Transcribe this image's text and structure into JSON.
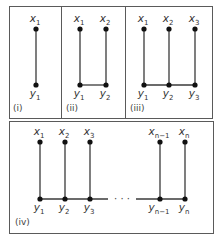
{
  "colors": {
    "border": "#5a5a5a",
    "edge": "#3a3a3a",
    "node": "#111111",
    "text": "#333333"
  },
  "panels": [
    {
      "id": "i",
      "caption": "(i)",
      "box": {
        "x": 9,
        "y": 6,
        "w": 52,
        "h": 112
      },
      "caption_pos": {
        "x": 13,
        "y": 111
      },
      "top_y": 29,
      "bottom_y": 85,
      "columns": [
        {
          "x": 36,
          "top": "x",
          "top_sub": "1",
          "bottom": "y",
          "bottom_sub": "1"
        }
      ],
      "base_line": null
    },
    {
      "id": "ii",
      "caption": "(ii)",
      "box": {
        "x": 61,
        "y": 6,
        "w": 64,
        "h": 112
      },
      "caption_pos": {
        "x": 66,
        "y": 111
      },
      "top_y": 29,
      "bottom_y": 85,
      "columns": [
        {
          "x": 80,
          "top": "x",
          "top_sub": "1",
          "bottom": "y",
          "bottom_sub": "1"
        },
        {
          "x": 106,
          "top": "x",
          "top_sub": "2",
          "bottom": "y",
          "bottom_sub": "2"
        }
      ],
      "base_line": {
        "x1": 80,
        "x2": 106
      }
    },
    {
      "id": "iii",
      "caption": "(iii)",
      "box": {
        "x": 125,
        "y": 6,
        "w": 87,
        "h": 112
      },
      "caption_pos": {
        "x": 130,
        "y": 111
      },
      "top_y": 29,
      "bottom_y": 85,
      "columns": [
        {
          "x": 144,
          "top": "x",
          "top_sub": "1",
          "bottom": "y",
          "bottom_sub": "1"
        },
        {
          "x": 169,
          "top": "x",
          "top_sub": "2",
          "bottom": "y",
          "bottom_sub": "2"
        },
        {
          "x": 195,
          "top": "x",
          "top_sub": "3",
          "bottom": "y",
          "bottom_sub": "3"
        }
      ],
      "base_line": {
        "x1": 144,
        "x2": 195
      }
    },
    {
      "id": "iv",
      "caption": "(iv)",
      "box": {
        "x": 9,
        "y": 121,
        "w": 204,
        "h": 112
      },
      "caption_pos": {
        "x": 15,
        "y": 225
      },
      "top_y": 142,
      "bottom_y": 199,
      "columns": [
        {
          "x": 40,
          "top": "x",
          "top_sub": "1",
          "bottom": "y",
          "bottom_sub": "1"
        },
        {
          "x": 65,
          "top": "x",
          "top_sub": "2",
          "bottom": "y",
          "bottom_sub": "2"
        },
        {
          "x": 90,
          "top": "x",
          "top_sub": "3",
          "bottom": "y",
          "bottom_sub": "3"
        },
        {
          "x": 160,
          "top": "x",
          "top_sub": "n−1",
          "bottom": "y",
          "bottom_sub": "n−1"
        },
        {
          "x": 185,
          "top": "x",
          "top_sub": "n",
          "bottom": "y",
          "bottom_sub": "n"
        }
      ],
      "base_segments": [
        {
          "x1": 40,
          "x2": 108
        },
        {
          "x1": 136,
          "x2": 185
        }
      ],
      "ellipsis": {
        "text": "· · ·",
        "x": 122,
        "y": 202
      }
    }
  ]
}
